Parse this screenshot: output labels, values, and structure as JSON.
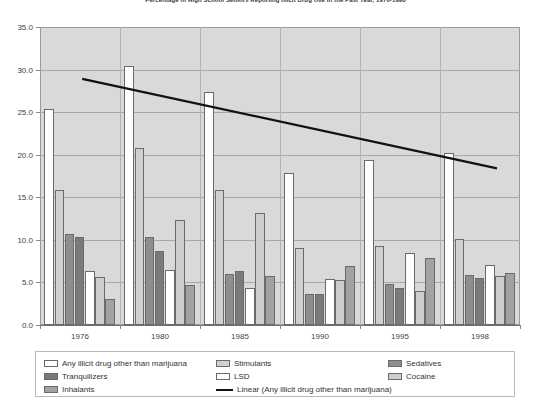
{
  "chart_data": {
    "type": "bar",
    "title": "Percentage of High School Seniors Reporting Illicit Drug Use in the Past Year, 1976-1998",
    "xlabel": "",
    "ylabel": "",
    "categories": [
      "1976",
      "1980",
      "1985",
      "1990",
      "1995",
      "1998"
    ],
    "ylim": [
      0.0,
      35.0
    ],
    "yticks": [
      "0.0",
      "5.0",
      "10.0",
      "15.0",
      "20.0",
      "25.0",
      "30.0",
      "35.0"
    ],
    "ytick_values": [
      0.0,
      5.0,
      10.0,
      15.0,
      20.0,
      25.0,
      30.0,
      35.0
    ],
    "grid": true,
    "legend_position": "bottom",
    "series": [
      {
        "name": "Any illicit drug other than marijuana",
        "color": "#ffffff",
        "values": [
          25.4,
          30.4,
          27.4,
          17.9,
          19.4,
          20.2
        ]
      },
      {
        "name": "Stimulants",
        "color": "#d0d0d0",
        "values": [
          15.8,
          20.8,
          15.8,
          9.1,
          9.3,
          10.1
        ]
      },
      {
        "name": "Sedatives",
        "color": "#8e8e8e",
        "values": [
          10.7,
          10.3,
          6.0,
          3.6,
          4.8,
          5.9
        ]
      },
      {
        "name": "Tranquilizers",
        "color": "#7a7a7a",
        "values": [
          10.3,
          8.7,
          6.3,
          3.7,
          4.4,
          5.5
        ]
      },
      {
        "name": "LSD",
        "color": "#ffffff",
        "values": [
          6.4,
          6.5,
          4.4,
          5.4,
          8.4,
          7.0
        ]
      },
      {
        "name": "Cocaine",
        "color": "#cdcdcd",
        "values": [
          5.6,
          12.3,
          13.1,
          5.3,
          4.0,
          5.7
        ]
      },
      {
        "name": "Inhalants",
        "color": "#a2a2a2",
        "values": [
          3.0,
          4.7,
          5.7,
          6.9,
          7.9,
          6.1
        ]
      }
    ],
    "trendline": {
      "name": "Linear (Any illicit drug other than marijuana)",
      "color": "#111111",
      "start": {
        "x_fraction": 0.088,
        "value": 28.9
      },
      "end": {
        "x_fraction": 0.952,
        "value": 18.4
      }
    }
  },
  "legend": {
    "entries": [
      {
        "label": "Any illicit drug other than marijuana",
        "swatch": "#ffffff",
        "kind": "swatch"
      },
      {
        "label": "Stimulants",
        "swatch": "#d0d0d0",
        "kind": "swatch"
      },
      {
        "label": "Sedatives",
        "swatch": "#8e8e8e",
        "kind": "swatch"
      },
      {
        "label": "Tranquilizers",
        "swatch": "#7a7a7a",
        "kind": "swatch"
      },
      {
        "label": "LSD",
        "swatch": "#ffffff",
        "kind": "swatch"
      },
      {
        "label": "Cocaine",
        "swatch": "#cdcdcd",
        "kind": "swatch"
      },
      {
        "label": "Inhalants",
        "swatch": "#a2a2a2",
        "kind": "swatch"
      },
      {
        "label": "Linear (Any illicit drug other than marijuana)",
        "swatch": "#111111",
        "kind": "line"
      }
    ]
  }
}
